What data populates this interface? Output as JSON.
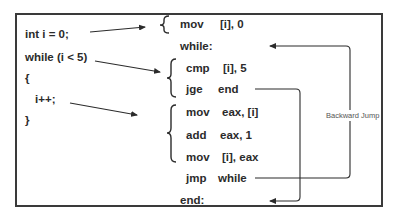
{
  "source_code": {
    "lines": [
      "int i = 0;",
      "while (i < 5)",
      "{",
      "i++;",
      "}"
    ]
  },
  "assembly": {
    "init": [
      {
        "op": "mov",
        "arg": "[i], 0"
      }
    ],
    "while_label": "while:",
    "condition": [
      {
        "op": "cmp",
        "arg": "[i], 5"
      },
      {
        "op": "jge",
        "arg": "end"
      }
    ],
    "body": [
      {
        "op": "mov",
        "arg": "eax, [i]"
      },
      {
        "op": "add",
        "arg": "eax, 1"
      },
      {
        "op": "mov",
        "arg": "[i], eax"
      }
    ],
    "jump": {
      "op": "jmp",
      "arg": "while"
    },
    "end_label": "end:"
  },
  "annotations": {
    "backward_jump": "Backward Jump"
  },
  "colors": {
    "line": "#2b2b2b",
    "frame": "#3a3a3a",
    "label": "#555555"
  }
}
